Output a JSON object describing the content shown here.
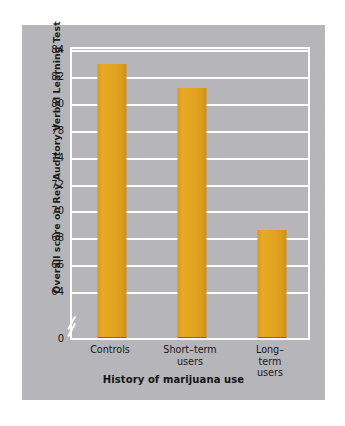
{
  "chart_data": {
    "type": "bar",
    "title": "",
    "xlabel": "History of marijuana use",
    "ylabel": "Overall score on Rey Auditory Verbal Learning Test",
    "categories": [
      "Controls",
      "Short–term\nusers",
      "Long–term\nusers"
    ],
    "values": [
      82.8,
      81.0,
      70.5
    ],
    "ytick_labels": [
      "84",
      "82",
      "80",
      "78",
      "74",
      "72",
      "70",
      "68",
      "66",
      "64",
      "0"
    ],
    "ytick_values": [
      84,
      82,
      80,
      78,
      76,
      74,
      72,
      70,
      68,
      66,
      0
    ],
    "ylim": [
      64,
      84
    ],
    "axis_break": true,
    "axis_break_label": "0",
    "grid": true,
    "grid_color": "#ffffff",
    "legend": false,
    "bar_color": "#e5a420",
    "panel_color": "#b5b5ba",
    "page_color": "#ffffff",
    "text_color": "#181818"
  },
  "axes": {
    "y_title": "Overall score on Rey Auditory Verbal Learning Test",
    "x_title": "History of marijuana use"
  }
}
